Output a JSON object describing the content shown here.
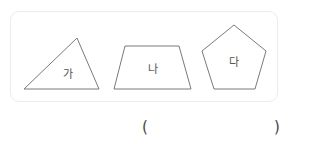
{
  "shapes": [
    {
      "id": "ga",
      "label": "가",
      "type": "triangle",
      "points": "24,89 77,38 99,89",
      "label_pos": [
        68,
        73
      ]
    },
    {
      "id": "na",
      "label": "나",
      "type": "trapezoid",
      "points": "125,46 179,46 191,89 114,89",
      "label_pos": [
        153,
        68
      ]
    },
    {
      "id": "da",
      "label": "다",
      "type": "pentagon",
      "points": "234,25 266,51 255,89 214,89 202,51",
      "label_pos": [
        234,
        61
      ]
    }
  ],
  "answer": {
    "open": "(",
    "close": ")",
    "value": ""
  },
  "colors": {
    "stroke": "#7a7a7a",
    "border": "#ececec",
    "text": "#555555"
  }
}
